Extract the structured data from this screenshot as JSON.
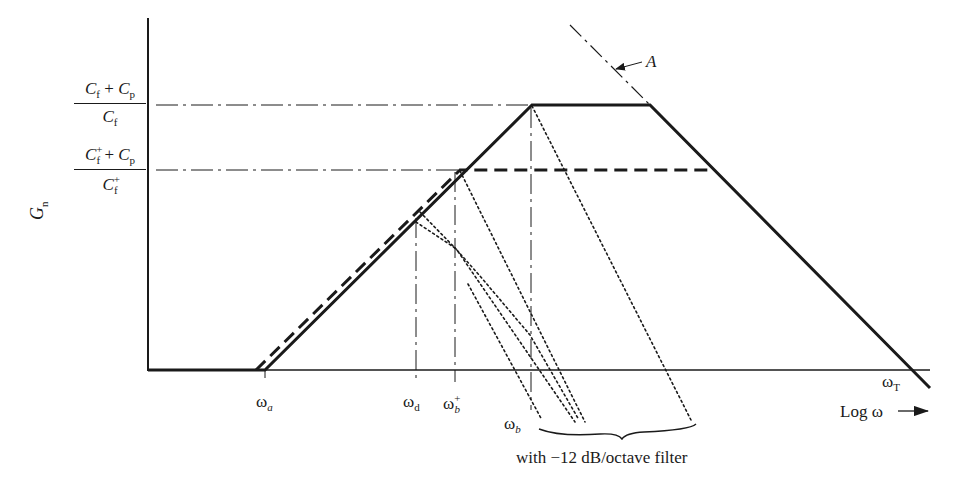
{
  "diagram": {
    "y_axis_label": "G",
    "y_axis_label_sub": "n",
    "x_axis_label": "Log ω",
    "levels": {
      "upper": {
        "num_a": "C",
        "num_a_sub": "f",
        "plus": " + ",
        "num_b": "C",
        "num_b_sub": "p",
        "den": "C",
        "den_sub": "f"
      },
      "lower": {
        "num_a": "C",
        "num_a_sub": "f",
        "num_a_sup": "+",
        "plus": " + ",
        "num_b": "C",
        "num_b_sub": "p",
        "den": "C",
        "den_sub": "f",
        "den_sup": "+"
      }
    },
    "x_markers": [
      {
        "id": "omega_a",
        "symbol": "ω",
        "sub": "a"
      },
      {
        "id": "omega_d",
        "symbol": "ω",
        "sub": "d"
      },
      {
        "id": "omega_b_plus",
        "symbol": "ω",
        "sub": "b",
        "sup": "+"
      },
      {
        "id": "omega_b",
        "symbol": "ω",
        "sub": "b"
      },
      {
        "id": "omega_T",
        "symbol": "ω",
        "sub": "T"
      }
    ],
    "annotation_A": "A",
    "brace_caption": "with −12 dB/octave filter",
    "colors": {
      "ink": "#1a1a1a",
      "background": "#ffffff"
    }
  }
}
